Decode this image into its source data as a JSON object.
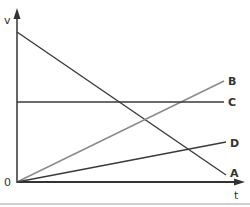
{
  "diagram": {
    "axes": {
      "y_label": "v",
      "x_label": "t",
      "origin_label": "0"
    },
    "lines": [
      {
        "label": "A",
        "description": "decreasing straight line from high v at t=0 to near zero",
        "color": "#3a3a3a"
      },
      {
        "label": "B",
        "description": "increasing straight line from origin, steeper",
        "color": "#8a8a8a"
      },
      {
        "label": "C",
        "description": "horizontal line, constant v",
        "color": "#3a3a3a"
      },
      {
        "label": "D",
        "description": "increasing straight line from origin, shallower",
        "color": "#3a3a3a"
      }
    ]
  }
}
